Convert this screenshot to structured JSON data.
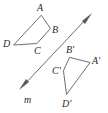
{
  "figure": {
    "background_color": "#ffffff",
    "stroke_color": "#6e6e6e",
    "label_color": "#2b2b2b",
    "width": 108,
    "height": 113
  },
  "mirror_line": {
    "name": "m",
    "label": "m",
    "label_x": 24,
    "label_y": 103,
    "start_x": 19,
    "start_y": 90,
    "end_x": 92,
    "end_y": 13,
    "arrow_heads": "both",
    "color": "#6e6e6e"
  },
  "preimage": {
    "name": "ABCD",
    "vertices": [
      {
        "label": "A",
        "x": 41.5,
        "y": 15.5,
        "label_x": 37,
        "label_y": 11
      },
      {
        "label": "B",
        "x": 50.5,
        "y": 28.5,
        "label_x": 52,
        "label_y": 33
      },
      {
        "label": "C",
        "x": 37.0,
        "y": 43.5,
        "label_x": 34,
        "label_y": 54
      },
      {
        "label": "D",
        "x": 14.0,
        "y": 45.0,
        "label_x": 3,
        "label_y": 47
      }
    ],
    "edge_order": "A-B-C-D-A"
  },
  "image": {
    "name": "A'B'C'D'",
    "vertices": [
      {
        "label": "B'",
        "x": 70.0,
        "y": 57.5,
        "label_x": 66,
        "label_y": 53
      },
      {
        "label": "A'",
        "x": 90.0,
        "y": 62.5,
        "label_x": 92,
        "label_y": 64
      },
      {
        "label": "D'",
        "x": 66.5,
        "y": 94.5,
        "label_x": 62,
        "label_y": 107
      },
      {
        "label": "C'",
        "x": 63.5,
        "y": 71.0,
        "label_x": 52,
        "label_y": 74
      }
    ],
    "edge_order": "B'-A'-D'-C'-B'"
  }
}
